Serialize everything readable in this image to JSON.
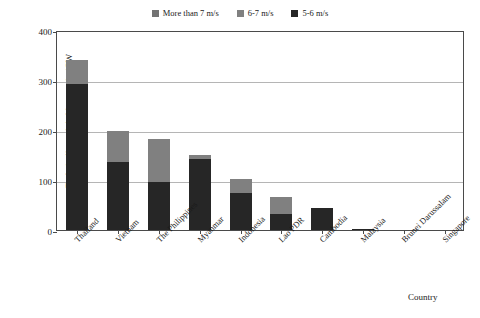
{
  "chart_data": {
    "type": "bar",
    "subtype": "stacked-vertical",
    "title": "",
    "xlabel": "Country",
    "ylabel": "Technically exploitable capacity/GW",
    "ylim": [
      0,
      400
    ],
    "yticks": [
      0,
      100,
      200,
      300,
      400
    ],
    "grid": true,
    "legend_position": "top-center",
    "categories": [
      "Thailand",
      "Vietnam",
      "The Philippines",
      "Myanmar",
      "Indonesia",
      "Lao PDR",
      "Cambodia",
      "Malaysia",
      "Brunei Darussalam",
      "Singapore"
    ],
    "series": [
      {
        "name": "5-6 m/s",
        "color": "#262626",
        "values": [
          293,
          137,
          96,
          143,
          75,
          32,
          44,
          2,
          0,
          0
        ]
      },
      {
        "name": "6-7 m/s",
        "color": "#808080",
        "values": [
          48,
          61,
          86,
          7,
          27,
          34,
          0,
          0,
          0,
          0
        ]
      },
      {
        "name": "More than 7 m/s",
        "color": "#737373",
        "values": [
          0,
          0,
          0,
          0,
          0,
          0,
          0,
          0,
          0,
          0
        ]
      }
    ],
    "totals": [
      341,
      198,
      182,
      150,
      102,
      66,
      44,
      2,
      0,
      0
    ]
  },
  "legend": {
    "items": [
      {
        "label": "More than 7 m/s",
        "color": "#737373"
      },
      {
        "label": "6-7 m/s",
        "color": "#808080"
      },
      {
        "label": "5-6 m/s",
        "color": "#262626"
      }
    ]
  },
  "axes": {
    "y_title": "Technically exploitable capacity/GW",
    "x_title": "Country",
    "y_tick_labels": [
      "400",
      "300",
      "200",
      "100",
      "0"
    ]
  },
  "caption": {
    "text": ""
  }
}
